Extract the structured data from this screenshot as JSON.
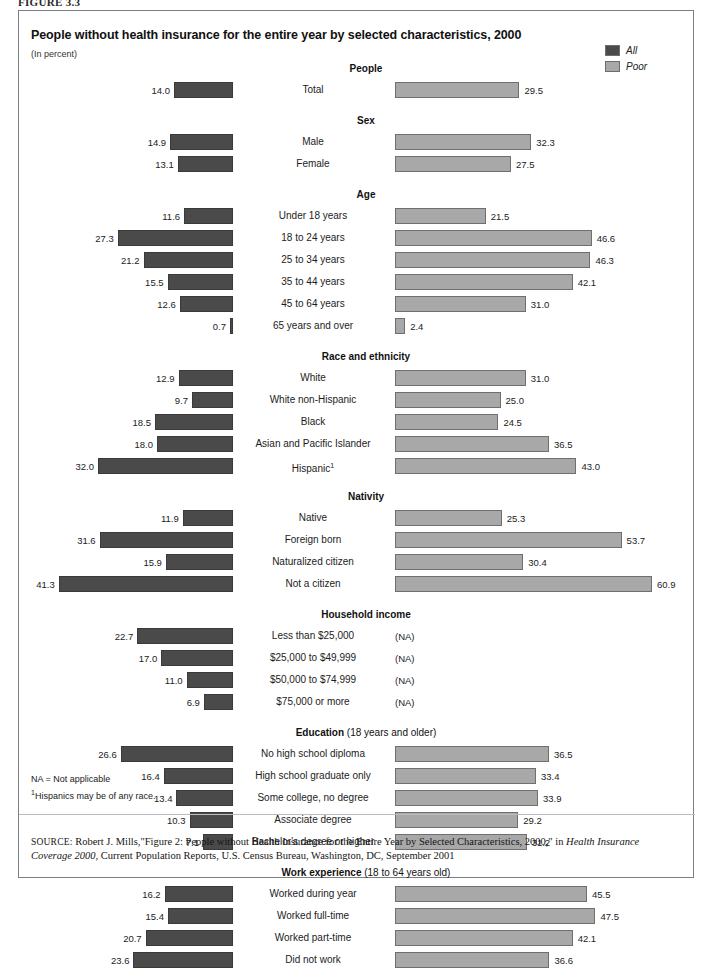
{
  "figure_label": "FIGURE 3.3",
  "title": "People without health insurance for the entire year by selected characteristics, 2000",
  "units": "(In percent)",
  "legend": {
    "items": [
      {
        "label": "All",
        "color": "#4a4a4a",
        "key": "all"
      },
      {
        "label": "Poor",
        "color": "#a8a8a8",
        "key": "poor"
      }
    ]
  },
  "footnotes": {
    "na": "NA = Not applicable",
    "hispanic_marker": "1",
    "hispanic": "Hispanics may be of any race."
  },
  "source": {
    "prefix": "SOURCE:",
    "text_1": " Robert J. Mills,\"Figure 2: People without Health Insurance for the Entire Year by Selected Characteristics, 2000,\" in ",
    "italic_1": "Health Insurance Coverage 2000",
    "text_2": ", Current Population Reports, U.S. Census Bureau, Washington, DC, September 2001"
  },
  "chart_data": {
    "type": "bar",
    "title": "People without health insurance for the entire year by selected characteristics, 2000",
    "xlabel": "",
    "ylabel": "",
    "units": "percent",
    "orientation": "horizontal",
    "layout": "diverging-paired",
    "grid": false,
    "legend_position": "top-right",
    "xlim_left": [
      0,
      45
    ],
    "xlim_right": [
      0,
      63
    ],
    "series": [
      {
        "name": "All",
        "color": "#4a4a4a",
        "side": "left"
      },
      {
        "name": "Poor",
        "color": "#a8a8a8",
        "side": "right"
      }
    ],
    "na_marker": "(NA)",
    "sections": [
      {
        "heading": "People",
        "heading_sub": "",
        "rows": [
          {
            "category": "Total",
            "all": 14.0,
            "poor": 29.5
          }
        ]
      },
      {
        "heading": "Sex",
        "heading_sub": "",
        "rows": [
          {
            "category": "Male",
            "all": 14.9,
            "poor": 32.3
          },
          {
            "category": "Female",
            "all": 13.1,
            "poor": 27.5
          }
        ]
      },
      {
        "heading": "Age",
        "heading_sub": "",
        "rows": [
          {
            "category": "Under 18 years",
            "all": 11.6,
            "poor": 21.5
          },
          {
            "category": "18 to 24 years",
            "all": 27.3,
            "poor": 46.6
          },
          {
            "category": "25 to 34 years",
            "all": 21.2,
            "poor": 46.3
          },
          {
            "category": "35 to 44 years",
            "all": 15.5,
            "poor": 42.1
          },
          {
            "category": "45 to 64 years",
            "all": 12.6,
            "poor": 31.0
          },
          {
            "category": "65 years and over",
            "all": 0.7,
            "poor": 2.4
          }
        ]
      },
      {
        "heading": "Race and ethnicity",
        "heading_sub": "",
        "rows": [
          {
            "category": "White",
            "all": 12.9,
            "poor": 31.0
          },
          {
            "category": "White non-Hispanic",
            "all": 9.7,
            "poor": 25.0
          },
          {
            "category": "Black",
            "all": 18.5,
            "poor": 24.5
          },
          {
            "category": "Asian and Pacific Islander",
            "all": 18.0,
            "poor": 36.5
          },
          {
            "category": "Hispanic",
            "footnote": "1",
            "all": 32.0,
            "poor": 43.0
          }
        ]
      },
      {
        "heading": "Nativity",
        "heading_sub": "",
        "rows": [
          {
            "category": "Native",
            "all": 11.9,
            "poor": 25.3
          },
          {
            "category": "Foreign born",
            "all": 31.6,
            "poor": 53.7
          },
          {
            "category": "Naturalized citizen",
            "all": 15.9,
            "poor": 30.4
          },
          {
            "category": "Not a citizen",
            "all": 41.3,
            "poor": 60.9
          }
        ]
      },
      {
        "heading": "Household income",
        "heading_sub": "",
        "rows": [
          {
            "category": "Less than $25,000",
            "all": 22.7,
            "poor": null
          },
          {
            "category": "$25,000 to $49,999",
            "all": 17.0,
            "poor": null
          },
          {
            "category": "$50,000 to $74,999",
            "all": 11.0,
            "poor": null
          },
          {
            "category": "$75,000 or more",
            "all": 6.9,
            "poor": null
          }
        ]
      },
      {
        "heading": "Education",
        "heading_sub": " (18 years and older)",
        "rows": [
          {
            "category": "No high school diploma",
            "all": 26.6,
            "poor": 36.5
          },
          {
            "category": "High school graduate only",
            "all": 16.4,
            "poor": 33.4
          },
          {
            "category": "Some college, no degree",
            "all": 13.4,
            "poor": 33.9
          },
          {
            "category": "Associate degree",
            "all": 10.3,
            "poor": 29.2
          },
          {
            "category": "Bachelor's degree or higher",
            "all": 7.1,
            "poor": 31.2
          }
        ]
      },
      {
        "heading": "Work experience",
        "heading_sub": " (18 to 64 years old)",
        "rows": [
          {
            "category": "Worked during year",
            "all": 16.2,
            "poor": 45.5
          },
          {
            "category": "Worked full-time",
            "all": 15.4,
            "poor": 47.5
          },
          {
            "category": "Worked part-time",
            "all": 20.7,
            "poor": 42.1
          },
          {
            "category": "Did not work",
            "all": 23.6,
            "poor": 36.6
          }
        ]
      }
    ]
  }
}
